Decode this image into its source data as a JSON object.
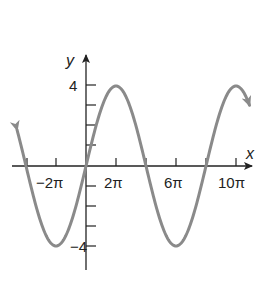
{
  "chart_data": {
    "type": "line",
    "title": "",
    "function": "y = 4 sin(x/4)",
    "xlabel": "x",
    "ylabel": "y",
    "x_tick_labels": [
      "-2π",
      "2π",
      "6π",
      "10π"
    ],
    "y_tick_labels": [
      "4",
      "-4"
    ],
    "x_ticks_multiples_of_pi": [
      -4,
      -2,
      0,
      2,
      4,
      6,
      8,
      10
    ],
    "y_ticks": [
      -4,
      -3,
      -2,
      -1,
      1,
      2,
      3,
      4
    ],
    "xlim_multiples_of_pi": [
      -5,
      11
    ],
    "ylim": [
      -5,
      5
    ],
    "amplitude": 4,
    "period_multiples_of_pi": 8,
    "key_points": [
      {
        "x": "-4π",
        "y": 0
      },
      {
        "x": "-2π",
        "y": -4
      },
      {
        "x": "0",
        "y": 0
      },
      {
        "x": "2π",
        "y": 4
      },
      {
        "x": "4π",
        "y": 0
      },
      {
        "x": "6π",
        "y": -4
      },
      {
        "x": "8π",
        "y": 0
      },
      {
        "x": "10π",
        "y": 4
      }
    ],
    "grid": false,
    "legend": null,
    "curve_color": "#8a8a8a",
    "axis_color": "#222222"
  },
  "labels": {
    "x_axis": "x",
    "y_axis": "y",
    "x_ticks": [
      "−2π",
      "2π",
      "6π",
      "10π"
    ],
    "y_top": "4",
    "y_bottom": "−4"
  }
}
